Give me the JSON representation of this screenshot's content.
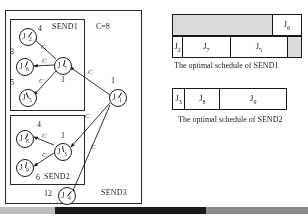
{
  "figure": {
    "graph": {
      "cost_annotation": "C=8",
      "regions": [
        {
          "name": "SEND1",
          "label": "SEND1"
        },
        {
          "name": "SEND2",
          "label": "SEND2"
        },
        {
          "name": "SEND3",
          "label": "SEND3"
        }
      ],
      "nodes": [
        {
          "id": "J2",
          "letter": "J",
          "sub": "2",
          "weight": "4",
          "x": 13,
          "y": 17
        },
        {
          "id": "J6",
          "letter": "J",
          "sub": "6",
          "weight": "3",
          "x": 10,
          "y": 47
        },
        {
          "id": "J5",
          "letter": "J",
          "sub": "5",
          "weight": "5",
          "x": 13,
          "y": 78
        },
        {
          "id": "J7",
          "letter": "J",
          "sub": "7",
          "weight": "1",
          "x": 48,
          "y": 46
        },
        {
          "id": "J8",
          "letter": "J",
          "sub": "8",
          "weight": "4",
          "x": 10,
          "y": 119
        },
        {
          "id": "J9",
          "letter": "J",
          "sub": "9",
          "weight": "6",
          "x": 10,
          "y": 148
        },
        {
          "id": "J3",
          "letter": "J",
          "sub": "3",
          "weight": "1",
          "x": 48,
          "y": 132
        },
        {
          "id": "J1",
          "letter": "J",
          "sub": "1",
          "weight": "1",
          "x": 103,
          "y": 78
        },
        {
          "id": "J4",
          "letter": "J",
          "sub": "4",
          "weight": "12",
          "x": 52,
          "y": 176
        }
      ],
      "edges": [
        {
          "from": "J7",
          "to": "J2",
          "label": "C"
        },
        {
          "from": "J7",
          "to": "J6",
          "label": "C"
        },
        {
          "from": "J7",
          "to": "J5",
          "label": "C"
        },
        {
          "from": "J1",
          "to": "J7",
          "label": "C"
        },
        {
          "from": "J3",
          "to": "J8",
          "label": "C"
        },
        {
          "from": "J3",
          "to": "J9",
          "label": "C"
        },
        {
          "from": "J1",
          "to": "J3",
          "label": "C"
        },
        {
          "from": "J1",
          "to": "J4",
          "label": "C"
        }
      ]
    },
    "schedules": [
      {
        "id": "send1",
        "caption": "The optimal schedule of SEND1",
        "rows": [
          {
            "name": "upper-row",
            "cells": [
              {
                "label": "",
                "shaded": true,
                "width_pct": 78
              },
              {
                "label": "J",
                "sub": "6",
                "shaded": false,
                "width_pct": 22
              }
            ]
          },
          {
            "name": "lower-row",
            "cells": [
              {
                "label": "J",
                "sub": "2",
                "shaded": false,
                "width_pct": 8
              },
              {
                "label": "J",
                "sub": "7",
                "shaded": false,
                "width_pct": 37
              },
              {
                "label": "J",
                "sub": "5",
                "shaded": false,
                "width_pct": 45
              },
              {
                "label": "",
                "shaded": true,
                "width_pct": 10
              }
            ]
          }
        ]
      },
      {
        "id": "send2",
        "caption": "The optimal schedule of SEND2",
        "rows": [
          {
            "name": "single-row",
            "cells": [
              {
                "label": "J",
                "sub": "3",
                "shaded": false,
                "width_pct": 11
              },
              {
                "label": "J",
                "sub": "8",
                "shaded": false,
                "width_pct": 31
              },
              {
                "label": "J",
                "sub": "9",
                "shaded": false,
                "width_pct": 58
              }
            ]
          }
        ]
      }
    ],
    "bottom_bar": {
      "name": "page-edge-bar",
      "segments": [
        {
          "color": "#bdbdbd",
          "left_pct": 0,
          "width_pct": 18
        },
        {
          "color": "#1a1a1a",
          "left_pct": 18,
          "width_pct": 49
        },
        {
          "color": "#7a7a7a",
          "left_pct": 67,
          "width_pct": 33
        }
      ]
    }
  }
}
